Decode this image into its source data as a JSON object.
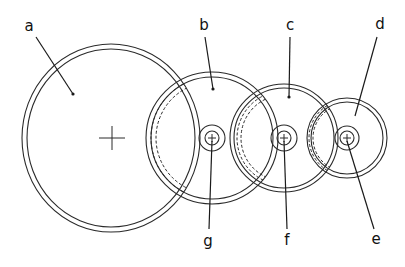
{
  "diagram": {
    "type": "gear-train",
    "background": "#ffffff",
    "stroke_color": "#2a2a2a",
    "gears": [
      {
        "id": "a",
        "cx": 111,
        "cy": 138,
        "rx_outer": 89,
        "ry_outer": 94,
        "rx_inner": 84,
        "ry_inner": 89,
        "dashed": [],
        "center_mark": "large-cross"
      },
      {
        "id": "b",
        "cx": 212,
        "cy": 138,
        "r_outer": 66,
        "r_inner": 61,
        "dashed": [
          61,
          56
        ],
        "dash_clip": "a",
        "hub": "g"
      },
      {
        "id": "c",
        "cx": 284,
        "cy": 138,
        "r_outer": 54,
        "r_inner": 50,
        "dashed": [
          47,
          43
        ],
        "dash_clip": "b",
        "hub": "f"
      },
      {
        "id": "d",
        "cx": 347,
        "cy": 138,
        "r_outer": 40,
        "r_inner": 36,
        "dashed": [
          38,
          34
        ],
        "dash_clip": "c",
        "hub": "e"
      }
    ],
    "hubs": [
      {
        "id": "g",
        "cx": 212,
        "cy": 138,
        "r_outer": 13,
        "r_inner": 7
      },
      {
        "id": "f",
        "cx": 284,
        "cy": 138,
        "r_outer": 13,
        "r_inner": 7
      },
      {
        "id": "e",
        "cx": 347,
        "cy": 138,
        "r_outer": 12,
        "r_inner": 7
      }
    ],
    "labels": [
      {
        "text": "a",
        "x": 29,
        "y": 31,
        "line": [
          36,
          37,
          73,
          94
        ],
        "dot": true
      },
      {
        "text": "b",
        "x": 204,
        "y": 30,
        "line": [
          205,
          37,
          213,
          89
        ],
        "dot": true
      },
      {
        "text": "c",
        "x": 290,
        "y": 30,
        "line": [
          290,
          37,
          289,
          97
        ],
        "dot": true
      },
      {
        "text": "d",
        "x": 380,
        "y": 29,
        "line": [
          377,
          37,
          355,
          116
        ],
        "dot": false
      },
      {
        "text": "g",
        "x": 208,
        "y": 246,
        "line": [
          212,
          141,
          209,
          229
        ],
        "dot": false
      },
      {
        "text": "f",
        "x": 287,
        "y": 245,
        "line": [
          284,
          141,
          287,
          229
        ],
        "dot": false
      },
      {
        "text": "e",
        "x": 376,
        "y": 244,
        "line": [
          347,
          141,
          374,
          229
        ],
        "dot": false
      }
    ]
  }
}
